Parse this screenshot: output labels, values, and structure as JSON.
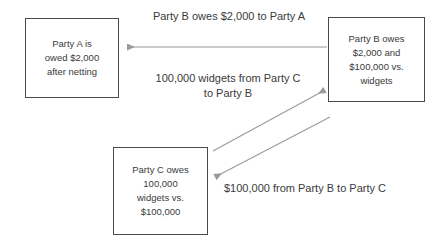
{
  "diagram": {
    "width": 444,
    "height": 240,
    "background_color": "#ffffff",
    "box_border_color": "#4a4a4a",
    "text_color": "#3a3a3a",
    "arrow_color": "#9a9a9a",
    "nodes": [
      {
        "id": "party-a",
        "label": "Party A is\nowed $2,000\nafter netting",
        "x": 25,
        "y": 18,
        "width": 94,
        "height": 80
      },
      {
        "id": "party-b",
        "label": "Party B owes\n$2,000 and\n$100,000 vs.\nwidgets",
        "x": 328,
        "y": 17,
        "width": 97,
        "height": 85
      },
      {
        "id": "party-c",
        "label": "Party C owes\n100,000\nwidgets vs.\n$100,000",
        "x": 113,
        "y": 147,
        "width": 95,
        "height": 88
      }
    ],
    "edges": [
      {
        "id": "b-owes-a",
        "label": "Party B owes $2,000 to Party A",
        "from": "party-b",
        "to": "party-a",
        "direction": "right-to-left",
        "style": "straight-horizontal"
      },
      {
        "id": "widgets-c-to-b",
        "label": "100,000 widgets from Party C\nto Party B",
        "from": "party-c",
        "to": "party-b",
        "direction": "lower-left-to-upper-right",
        "style": "diagonal"
      },
      {
        "id": "cash-b-to-c",
        "label": "$100,000 from Party B to Party C",
        "from": "party-b",
        "to": "party-c",
        "direction": "upper-right-to-lower-left",
        "style": "diagonal"
      }
    ]
  }
}
